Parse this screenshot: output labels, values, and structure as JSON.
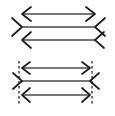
{
  "figure": {
    "type": "line-diagram",
    "canvas": {
      "width": 115,
      "height": 116,
      "background": "#ffffff"
    },
    "colors": {
      "shaft": "#4a4a4a",
      "fin": "#1c1c1c",
      "reference_line": "#262626",
      "background": "#ffffff"
    },
    "groups": [
      {
        "id": "upper-group",
        "name": "upper-arrow-group",
        "has_reference_lines": false,
        "shaft_x_start": 22,
        "shaft_x_end": 95,
        "rows": [
          {
            "id": "upper-row-1",
            "name": "double-headed-arrow",
            "y": 14,
            "left_cap": "arrowhead-outward",
            "right_cap": "arrowhead-outward",
            "fin_length": 9,
            "fin_spread": 7
          },
          {
            "id": "upper-row-2",
            "name": "inward-fin-line",
            "y": 27,
            "left_cap": "fin-inward",
            "right_cap": "fin-inward",
            "fin_length": 10,
            "fin_spread": 9
          },
          {
            "id": "upper-row-3",
            "name": "left-arrowhead-line",
            "y": 40,
            "left_cap": "arrowhead-outward",
            "right_cap": "fin-inward",
            "fin_length": 9,
            "fin_spread": 8
          }
        ]
      },
      {
        "id": "lower-group",
        "name": "lower-arrow-group",
        "has_reference_lines": true,
        "shaft_x_start": 22,
        "shaft_x_end": 90,
        "reference_lines": [
          {
            "id": "ref-left",
            "name": "left-reference-line",
            "x": 19,
            "y_top": 61,
            "y_bottom": 104
          },
          {
            "id": "ref-right",
            "name": "right-reference-line",
            "x": 92,
            "y_top": 61,
            "y_bottom": 104
          }
        ],
        "rows": [
          {
            "id": "lower-row-1",
            "name": "double-headed-arrow",
            "y": 68,
            "left_cap": "arrowhead-outward",
            "right_cap": "arrowhead-outward",
            "fin_length": 8,
            "fin_spread": 6
          },
          {
            "id": "lower-row-2",
            "name": "inward-fin-line",
            "y": 81,
            "left_cap": "fin-inward",
            "right_cap": "fin-inward",
            "fin_length": 9,
            "fin_spread": 8
          },
          {
            "id": "lower-row-3",
            "name": "left-arrowhead-line",
            "y": 95,
            "left_cap": "arrowhead-outward",
            "right_cap": "arrowhead-outward",
            "fin_length": 8,
            "fin_spread": 7
          }
        ]
      }
    ]
  }
}
